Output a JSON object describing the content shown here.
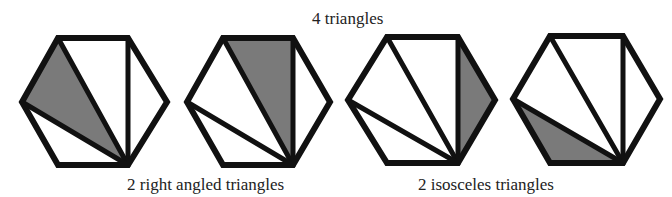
{
  "title": "4 triangles",
  "captions": {
    "right_angled": "2 right angled triangles",
    "isosceles": "2 isosceles triangles"
  },
  "colors": {
    "stroke": "#111111",
    "shade": "#7a7a7a",
    "fill": "#ffffff"
  },
  "hexagons": [
    {
      "id": "hexagon-1",
      "vertices": {
        "TL": [
          58,
          38
        ],
        "TR": [
          128,
          38
        ],
        "R": [
          167,
          102
        ],
        "BR": [
          128,
          165
        ],
        "BL": [
          58,
          165
        ],
        "L": [
          22,
          102
        ]
      },
      "shaded_triangle": [
        "L",
        "TL",
        "BR"
      ],
      "type": "right angled"
    },
    {
      "id": "hexagon-2",
      "vertices": {
        "TL": [
          223,
          38
        ],
        "TR": [
          293,
          38
        ],
        "R": [
          330,
          102
        ],
        "BR": [
          293,
          165
        ],
        "BL": [
          223,
          165
        ],
        "L": [
          187,
          102
        ]
      },
      "shaded_triangle": [
        "TL",
        "TR",
        "BR"
      ],
      "type": "right angled"
    },
    {
      "id": "hexagon-3",
      "vertices": {
        "TL": [
          387,
          37
        ],
        "TR": [
          458,
          37
        ],
        "R": [
          495,
          100
        ],
        "BR": [
          458,
          163
        ],
        "BL": [
          387,
          163
        ],
        "L": [
          348,
          100
        ]
      },
      "shaded_triangle": [
        "TR",
        "R",
        "BR"
      ],
      "type": "isosceles"
    },
    {
      "id": "hexagon-4",
      "vertices": {
        "TL": [
          550,
          36
        ],
        "TR": [
          623,
          36
        ],
        "R": [
          660,
          99
        ],
        "BR": [
          623,
          163
        ],
        "BL": [
          550,
          163
        ],
        "L": [
          513,
          99
        ]
      },
      "shaded_triangle": [
        "L",
        "BL",
        "BR"
      ],
      "type": "isosceles"
    }
  ]
}
